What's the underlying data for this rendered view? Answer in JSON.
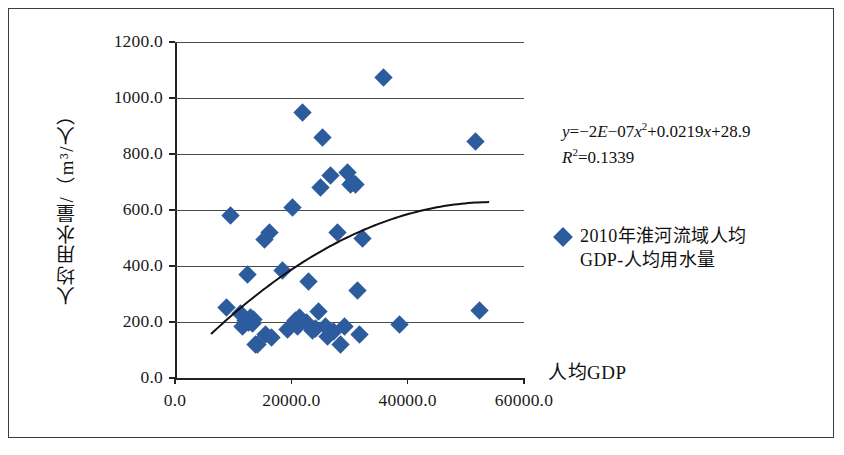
{
  "chart_data": {
    "type": "scatter",
    "title": "",
    "xlabel": "人均GDP",
    "ylabel": "人均用水量/（m³/人）",
    "xlim": [
      0,
      60000
    ],
    "ylim": [
      0,
      1200
    ],
    "grid": true,
    "xticks": [
      "0.0",
      "20000.0",
      "40000.0",
      "60000.0"
    ],
    "xtick_values": [
      0,
      20000,
      40000,
      60000
    ],
    "yticks": [
      "0.0",
      "200.0",
      "400.0",
      "600.0",
      "800.0",
      "1000.0",
      "1200.0"
    ],
    "ytick_values": [
      0,
      200,
      400,
      600,
      800,
      1000,
      1200
    ],
    "marker_color": "#2d5c9e",
    "marker_shape": "diamond",
    "legend_position": "right",
    "series": [
      {
        "name": "2010年淮河流域人均GDP-人均用水量",
        "points": [
          [
            8900,
            253
          ],
          [
            9500,
            580
          ],
          [
            11200,
            230
          ],
          [
            11600,
            185
          ],
          [
            12200,
            205
          ],
          [
            12500,
            370
          ],
          [
            12700,
            200
          ],
          [
            12900,
            215
          ],
          [
            13300,
            195
          ],
          [
            13500,
            210
          ],
          [
            13900,
            120
          ],
          [
            14200,
            118
          ],
          [
            15400,
            495
          ],
          [
            15600,
            155
          ],
          [
            16200,
            520
          ],
          [
            16600,
            143
          ],
          [
            18500,
            385
          ],
          [
            19300,
            175
          ],
          [
            20200,
            610
          ],
          [
            20700,
            205
          ],
          [
            21000,
            185
          ],
          [
            21400,
            215
          ],
          [
            21900,
            950
          ],
          [
            22600,
            200
          ],
          [
            23000,
            345
          ],
          [
            23600,
            168
          ],
          [
            24200,
            178
          ],
          [
            24700,
            238
          ],
          [
            25100,
            680
          ],
          [
            25400,
            858
          ],
          [
            25800,
            185
          ],
          [
            26300,
            150
          ],
          [
            26800,
            725
          ],
          [
            27200,
            165
          ],
          [
            27900,
            520
          ],
          [
            28400,
            120
          ],
          [
            29100,
            185
          ],
          [
            29600,
            735
          ],
          [
            30100,
            690
          ],
          [
            30600,
            700
          ],
          [
            31000,
            690
          ],
          [
            31400,
            313
          ],
          [
            31800,
            155
          ],
          [
            32300,
            500
          ],
          [
            35800,
            1072
          ],
          [
            38600,
            190
          ],
          [
            51600,
            845
          ],
          [
            52400,
            240
          ]
        ]
      }
    ],
    "trendline": {
      "type": "polynomial",
      "order": 2,
      "equation_coefficients": {
        "a": -2e-07,
        "b": 0.0219,
        "c": 28.9
      },
      "x_start": 6200,
      "x_end": 54000,
      "color": "#111111"
    }
  },
  "annotations": {
    "equation_line1_prefix": "y",
    "equation_line1": "=−2E−07x²+0.0219x+28.9",
    "equation_line2": "=0.1339",
    "equation_y_var": "y",
    "equation_r_var": "R",
    "equation_r_sup": "2",
    "equation_full": "y=−2E−07x²+0.0219x+28.9",
    "r_squared_full": "R²=0.1339"
  },
  "legend": {
    "entries": [
      {
        "label_line1": "2010年淮河流域人均",
        "label_line2": "GDP-人均用水量",
        "label": "2010年淮河流域人均GDP-人均用水量",
        "color": "#2d5c9e",
        "marker": "diamond-marker"
      }
    ]
  },
  "axes": {
    "x_title": "人均GDP",
    "y_title": "人均用水量/（m³/人）"
  }
}
